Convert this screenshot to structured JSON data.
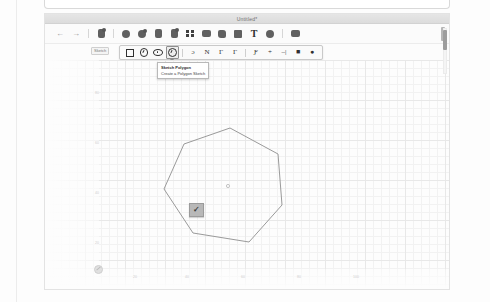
{
  "window": {
    "title": "Untitled*"
  },
  "toolbar": {
    "undo_label": "←",
    "redo_label": "→",
    "items": [
      {
        "name": "undo-button",
        "label": "Undo",
        "icon": "arrow-left-icon"
      },
      {
        "name": "redo-button",
        "label": "Redo",
        "icon": "arrow-right-icon"
      },
      {
        "name": "sketch-button",
        "label": "Sketch",
        "icon": "sketch-icon"
      },
      {
        "name": "extrude-button",
        "label": "Extrude",
        "icon": "extrude-icon"
      },
      {
        "name": "revolve-button",
        "label": "Revolve",
        "icon": "revolve-icon"
      },
      {
        "name": "sweep-button",
        "label": "Sweep",
        "icon": "sweep-icon"
      },
      {
        "name": "loft-button",
        "label": "Loft",
        "icon": "loft-icon"
      },
      {
        "name": "pattern-button",
        "label": "Pattern",
        "icon": "grid-pattern-icon"
      },
      {
        "name": "fillet-button",
        "label": "Fillet",
        "icon": "fillet-icon"
      },
      {
        "name": "chamfer-button",
        "label": "Chamfer",
        "icon": "chamfer-icon"
      },
      {
        "name": "shell-button",
        "label": "Shell",
        "icon": "shell-icon"
      },
      {
        "name": "text-button",
        "label": "Text",
        "icon": "text-t-icon"
      },
      {
        "name": "transform-button",
        "label": "Transform",
        "icon": "transform-icon"
      },
      {
        "name": "assembly-button",
        "label": "Assembly",
        "icon": "assembly-icon"
      }
    ]
  },
  "ribbon": {
    "group_label": "Sketch",
    "shape_tools": [
      {
        "name": "sketch-rectangle-tool",
        "label": "Rectangle",
        "active": false
      },
      {
        "name": "sketch-circle-tool",
        "label": "Circle",
        "active": false
      },
      {
        "name": "sketch-ellipse-tool",
        "label": "Ellipse",
        "active": false
      },
      {
        "name": "sketch-polygon-tool",
        "label": "Polygon",
        "active": true
      }
    ],
    "curve_tools": [
      {
        "name": "sketch-arc-tool",
        "label": "Arc",
        "glyph": "ɔ"
      },
      {
        "name": "sketch-spline-tool",
        "label": "Spline",
        "glyph": "N"
      },
      {
        "name": "sketch-curve-tool",
        "label": "Curve",
        "glyph": "Γ"
      },
      {
        "name": "sketch-point-curve-tool",
        "label": "Point Curve",
        "glyph": "Γ"
      }
    ],
    "modify_tools": [
      {
        "name": "sketch-fillet-tool",
        "label": "Sketch Fillet",
        "glyph": "Ƒ"
      },
      {
        "name": "sketch-trim-tool",
        "label": "Trim",
        "glyph": "+"
      },
      {
        "name": "sketch-extend-tool",
        "label": "Extend",
        "glyph": "–|"
      },
      {
        "name": "sketch-mirror-tool",
        "label": "Mirror",
        "glyph": "■"
      },
      {
        "name": "sketch-use-tool",
        "label": "Use",
        "glyph": "●"
      }
    ]
  },
  "tooltip": {
    "title": "Sketch Polygon",
    "description": "Create a Polygon Sketch"
  },
  "canvas": {
    "confirm_badge_label": "✓",
    "x_tick_labels": [
      "20",
      "40",
      "60",
      "80",
      "100"
    ],
    "y_tick_labels": [
      "80",
      "60",
      "40",
      "20"
    ],
    "origin_label": "Origin",
    "polygon": {
      "sides": 7,
      "name": "heptagon",
      "stroke_color": "#9a9a9a"
    },
    "grid_color": "#f2f2f2"
  }
}
